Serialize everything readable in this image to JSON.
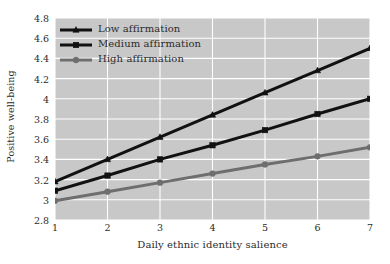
{
  "chart_data": {
    "type": "line",
    "title": "",
    "xlabel": "Daily ethnic identity salience",
    "ylabel": "Positive well-being",
    "x": [
      1,
      2,
      3,
      4,
      5,
      6,
      7
    ],
    "xtick_labels": [
      "1",
      "2",
      "3",
      "4",
      "5",
      "6",
      "7"
    ],
    "ytick_labels": [
      "2.8",
      "3",
      "3.2",
      "3.4",
      "3.6",
      "3.8",
      "4",
      "4.2",
      "4.4",
      "4.6",
      "4.8"
    ],
    "ytick_values": [
      2.8,
      3.0,
      3.2,
      3.4,
      3.6,
      3.8,
      4.0,
      4.2,
      4.4,
      4.6,
      4.8
    ],
    "xlim": [
      1,
      7
    ],
    "ylim": [
      2.8,
      4.8
    ],
    "grid": true,
    "legend_position": "upper-left",
    "plot_background": "#c8c8c8",
    "grid_color": "#ffffff",
    "series": [
      {
        "name": "Low affirmation",
        "marker": "triangle",
        "color": "#111111",
        "values": [
          3.18,
          3.4,
          3.62,
          3.84,
          4.06,
          4.28,
          4.5
        ]
      },
      {
        "name": "Medium affirmation",
        "marker": "square",
        "color": "#111111",
        "values": [
          3.09,
          3.24,
          3.4,
          3.54,
          3.69,
          3.85,
          4.0
        ]
      },
      {
        "name": "High affirmation",
        "marker": "circle",
        "color": "#6e6e6e",
        "values": [
          2.99,
          3.08,
          3.17,
          3.26,
          3.35,
          3.43,
          3.52
        ]
      }
    ]
  }
}
